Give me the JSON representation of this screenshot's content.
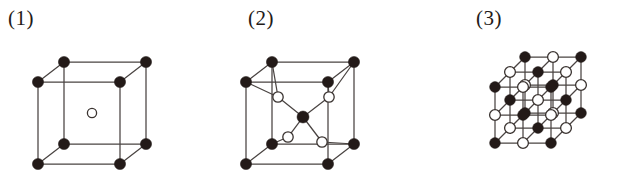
{
  "figure": {
    "background_color": "#ffffff",
    "line_color": "#4a4442",
    "filled_atom_color": "#231a18",
    "open_atom_fill": "#ffffff",
    "open_atom_stroke": "#3a3330"
  },
  "panels": [
    {
      "label": "(1)",
      "name": "body-centered-cubic",
      "structure_type": "body-centered cubic unit cell",
      "filled_atom_count": 8,
      "open_atom_count": 1,
      "open_atom_radius": 4.5,
      "filled_atom_radius": 5.6,
      "cube": {
        "front_left_x": 38,
        "front_top_y": 82,
        "front_size": 82,
        "depth_dx": 26,
        "depth_dy": -20
      },
      "center_atom": {
        "cx": 92,
        "cy": 113,
        "r": 4.6
      }
    },
    {
      "label": "(2)",
      "name": "diamond-zincblende-cell",
      "structure_type": "tetrahedral-coordination unit cell",
      "filled_atom_count": 9,
      "open_atom_count": 4,
      "open_atom_radius": 5.2,
      "filled_atom_radius": 5.6,
      "cube": {
        "front_left_x": 36,
        "front_top_y": 82,
        "front_size": 82,
        "depth_dx": 26,
        "depth_dy": -20
      },
      "central_atom": {
        "cx": 93,
        "cy": 117,
        "r": 6.0
      },
      "tetrahedral_neighbors": [
        {
          "cx": 68,
          "cy": 97
        },
        {
          "cx": 119,
          "cy": 97
        },
        {
          "cx": 78,
          "cy": 137
        },
        {
          "cx": 112,
          "cy": 142
        }
      ]
    },
    {
      "label": "(3)",
      "name": "rock-salt-lattice",
      "structure_type": "rock salt (NaCl) 3x3x3 lattice",
      "grid_n": 3,
      "filled_atom_count": 14,
      "open_atom_count": 13,
      "atom_radius": 5.4,
      "origin": {
        "x": 74,
        "y": 143
      },
      "step_x": 28,
      "step_y": -28,
      "depth_dx": 15,
      "depth_dy": -15
    }
  ]
}
